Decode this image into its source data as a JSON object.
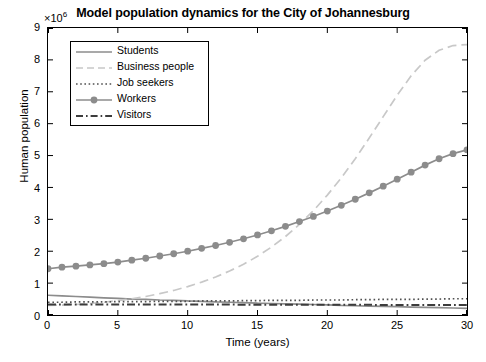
{
  "chart_data": {
    "type": "line",
    "title": "Model population dynamics for the City of Johannesburg",
    "xlabel": "Time (years)",
    "ylabel": "Human population",
    "y_exponent_label": "10",
    "y_exponent_power": "6",
    "xlim": [
      0,
      30
    ],
    "ylim": [
      0,
      9
    ],
    "xticks": [
      0,
      5,
      10,
      15,
      20,
      25,
      30
    ],
    "yticks": [
      0,
      1,
      2,
      3,
      4,
      5,
      6,
      7,
      8,
      9
    ],
    "xtick_labels": [
      "0",
      "5",
      "10",
      "15",
      "20",
      "25",
      "30"
    ],
    "ytick_labels": [
      "0",
      "1",
      "2",
      "3",
      "4",
      "5",
      "6",
      "7",
      "8",
      "9"
    ],
    "grid": false,
    "legend_position": "upper left",
    "x": [
      0,
      1,
      2,
      3,
      4,
      5,
      6,
      7,
      8,
      9,
      10,
      11,
      12,
      13,
      14,
      15,
      16,
      17,
      18,
      19,
      20,
      21,
      22,
      23,
      24,
      25,
      26,
      27,
      28,
      29,
      30
    ],
    "series": [
      {
        "name": "Students",
        "style": "solid",
        "color": "#8c8c8c",
        "values": [
          0.62,
          0.6,
          0.58,
          0.56,
          0.54,
          0.52,
          0.5,
          0.49,
          0.47,
          0.46,
          0.44,
          0.43,
          0.41,
          0.4,
          0.39,
          0.37,
          0.36,
          0.35,
          0.34,
          0.33,
          0.32,
          0.3,
          0.29,
          0.28,
          0.27,
          0.26,
          0.25,
          0.24,
          0.23,
          0.22,
          0.21
        ]
      },
      {
        "name": "Business people",
        "style": "dashed",
        "color": "#c8c8c8",
        "values": [
          0.3,
          0.31,
          0.33,
          0.36,
          0.4,
          0.45,
          0.51,
          0.58,
          0.67,
          0.77,
          0.89,
          1.03,
          1.19,
          1.38,
          1.59,
          1.84,
          2.13,
          2.46,
          2.84,
          3.27,
          3.76,
          4.3,
          4.9,
          5.55,
          6.22,
          6.89,
          7.5,
          7.99,
          8.3,
          8.45,
          8.48
        ]
      },
      {
        "name": "Job seekers",
        "style": "dotted",
        "color": "#505050",
        "values": [
          0.4,
          0.4,
          0.41,
          0.41,
          0.41,
          0.42,
          0.42,
          0.42,
          0.43,
          0.43,
          0.43,
          0.44,
          0.44,
          0.44,
          0.45,
          0.45,
          0.46,
          0.46,
          0.46,
          0.47,
          0.47,
          0.47,
          0.48,
          0.48,
          0.49,
          0.49,
          0.49,
          0.5,
          0.5,
          0.51,
          0.51
        ]
      },
      {
        "name": "Workers",
        "style": "solid-marker",
        "color": "#8c8c8c",
        "values": [
          1.45,
          1.5,
          1.53,
          1.57,
          1.61,
          1.66,
          1.72,
          1.78,
          1.85,
          1.92,
          2.0,
          2.09,
          2.18,
          2.28,
          2.39,
          2.51,
          2.64,
          2.78,
          2.93,
          3.09,
          3.26,
          3.44,
          3.63,
          3.83,
          4.04,
          4.26,
          4.48,
          4.7,
          4.9,
          5.06,
          5.18
        ]
      },
      {
        "name": "Visitors",
        "style": "dashdot",
        "color": "#3c3c3c",
        "values": [
          0.33,
          0.33,
          0.33,
          0.33,
          0.33,
          0.33,
          0.33,
          0.33,
          0.33,
          0.33,
          0.33,
          0.33,
          0.33,
          0.33,
          0.32,
          0.32,
          0.32,
          0.32,
          0.32,
          0.32,
          0.32,
          0.32,
          0.32,
          0.32,
          0.31,
          0.31,
          0.31,
          0.31,
          0.31,
          0.31,
          0.31
        ]
      }
    ]
  }
}
